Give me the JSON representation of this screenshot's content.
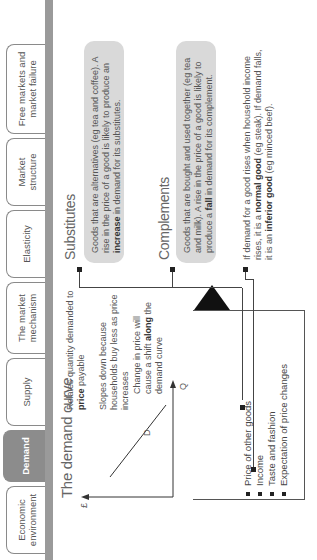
{
  "tabs": [
    {
      "label": "Economic environment",
      "active": false
    },
    {
      "label": "Demand",
      "active": true
    },
    {
      "label": "Supply",
      "active": false
    },
    {
      "label": "The market mechanism",
      "active": false
    },
    {
      "label": "Elasticity",
      "active": false
    },
    {
      "label": "Market structure",
      "active": false
    },
    {
      "label": "Free markets and market failure",
      "active": false
    }
  ],
  "demand_curve": {
    "title": "The demand curve",
    "y_axis_label": "£",
    "x_axis_label": "Q",
    "curve_label": "D",
    "point1": {
      "pre": "Relates quantity demanded to ",
      "bold": "price",
      "post": " payable"
    },
    "point2": "Slopes down because households buy less as price increases",
    "point3": {
      "pre": "Change in price will cause a shift ",
      "bold": "along",
      "post": " the demand curve"
    }
  },
  "substitutes": {
    "title": "Substitutes",
    "text_pre": "Goods that are alternatives (eg tea and coffee). A rise in the price of a good is likely to produce an ",
    "text_bold": "increase",
    "text_post": " in demand for its substitutes."
  },
  "complements": {
    "title": "Complements",
    "text_pre": "Goods that are bought and used together (eg tea and milk). A rise in the price of a good is likely to produce a ",
    "text_bold": "fall",
    "text_post": " in demand for its complement."
  },
  "income_note": {
    "t1": "If demand for a good rises when household income rises, it is a ",
    "b1": "normal good",
    "t2": " (eg steak). If demand falls, it is an ",
    "b2": "inferior good",
    "t3": " (eg minced beef)."
  },
  "influences": {
    "banner": "Demand is also influenced by",
    "items": [
      "Price of other goods",
      "Income",
      "Taste and fashion",
      "Expectation of price changes"
    ]
  },
  "colors": {
    "active_tab": "#8c8c8c",
    "bar": "#9a9a9a",
    "gray_box": "#d9d9d9",
    "banner": "#111111"
  }
}
